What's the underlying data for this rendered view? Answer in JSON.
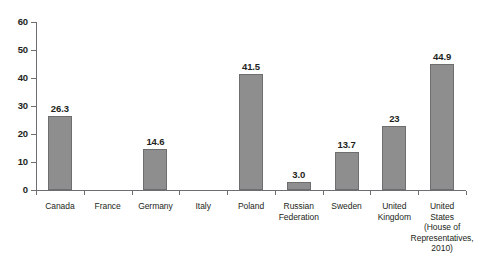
{
  "chart_data": {
    "type": "bar",
    "title": "",
    "xlabel": "",
    "ylabel": "",
    "ylim": [
      0,
      60
    ],
    "yticks": [
      0,
      10,
      20,
      30,
      40,
      50,
      60
    ],
    "grid": false,
    "legend": null,
    "bar_color": "#8e8e8e",
    "bar_border_color": "#6e6e6e",
    "categories": [
      "Canada",
      "France",
      "Germany",
      "Italy",
      "Poland",
      "Russian Federation",
      "Sweden",
      "United Kingdom",
      "United States (House of Representatives, 2010)"
    ],
    "values": [
      26.3,
      null,
      14.6,
      null,
      41.5,
      3.0,
      13.7,
      23,
      44.9
    ],
    "value_labels": [
      "26.3",
      "",
      "14.6",
      "",
      "41.5",
      "3.0",
      "13.7",
      "23",
      "44.9"
    ],
    "category_label_lines": [
      [
        "Canada"
      ],
      [
        "France"
      ],
      [
        "Germany"
      ],
      [
        "Italy"
      ],
      [
        "Poland"
      ],
      [
        "Russian",
        "Federation"
      ],
      [
        "Sweden"
      ],
      [
        "United",
        "Kingdom"
      ],
      [
        "United",
        "States",
        "(House of",
        "Representatives,",
        "2010)"
      ]
    ]
  },
  "axis": {
    "y_tick_labels": [
      "60",
      "50",
      "40",
      "30",
      "20",
      "10",
      "0"
    ]
  }
}
